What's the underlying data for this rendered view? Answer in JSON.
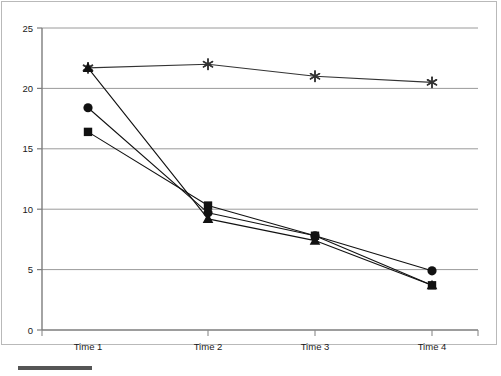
{
  "chart_data": {
    "type": "line",
    "title": "",
    "subtitle": "",
    "xlabel": "",
    "ylabel": "",
    "categories": [
      "Time 1",
      "Time 2",
      "Time 3",
      "Time 4"
    ],
    "ylim": [
      0,
      25
    ],
    "yticks": [
      0,
      5,
      10,
      15,
      20,
      25
    ],
    "grid": "horizontal",
    "legend": "none",
    "series": [
      {
        "name": "Asterisk series",
        "marker": "asterisk",
        "color": "#333333",
        "values": [
          21.7,
          22.0,
          21.0,
          20.5
        ]
      },
      {
        "name": "Circle series",
        "marker": "circle",
        "color": "#111111",
        "values": [
          18.4,
          9.7,
          7.8,
          4.9
        ]
      },
      {
        "name": "Square series",
        "marker": "square",
        "color": "#111111",
        "values": [
          16.4,
          10.3,
          7.8,
          3.7
        ]
      },
      {
        "name": "Triangle series",
        "marker": "triangle",
        "color": "#111111",
        "values": [
          21.7,
          9.2,
          7.4,
          3.7
        ]
      }
    ]
  },
  "axis": {
    "y_tick_labels": [
      "25",
      "20",
      "15",
      "10",
      "5",
      "0"
    ],
    "x_tick_labels": [
      "Time 1",
      "Time 2",
      "Time 3",
      "Time 4"
    ]
  },
  "footer": {
    "rule_label": ""
  }
}
